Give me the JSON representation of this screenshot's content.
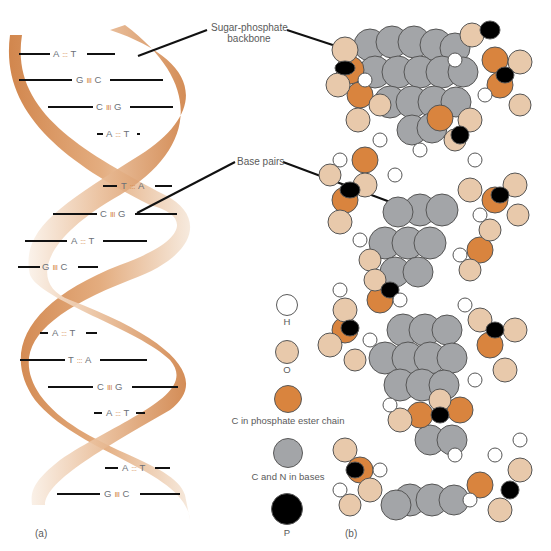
{
  "figure": {
    "panel_a_label": "(a)",
    "panel_b_label": "(b)",
    "callouts": {
      "backbone_line1": "Sugar-phosphate",
      "backbone_line2": "backbone",
      "base_pairs": "Base pairs"
    },
    "base_pairs": [
      {
        "left": "A",
        "bond": ":::",
        "right": "T"
      },
      {
        "left": "G",
        "bond": "III",
        "right": "C"
      },
      {
        "left": "C",
        "bond": "III",
        "right": "G"
      },
      {
        "left": "A",
        "bond": ":::",
        "right": "T"
      },
      {
        "left": "T",
        "bond": ":::",
        "right": "A"
      },
      {
        "left": "C",
        "bond": "III",
        "right": "G"
      },
      {
        "left": "A",
        "bond": ":::",
        "right": "T"
      },
      {
        "left": "G",
        "bond": "III",
        "right": "C"
      },
      {
        "left": "A",
        "bond": ":::",
        "right": "T"
      },
      {
        "left": "T",
        "bond": ":::",
        "right": "A"
      },
      {
        "left": "C",
        "bond": "III",
        "right": "G"
      },
      {
        "left": "A",
        "bond": ":::",
        "right": "T"
      },
      {
        "left": "A",
        "bond": ":::",
        "right": "T"
      },
      {
        "left": "G",
        "bond": "III",
        "right": "C"
      }
    ],
    "legend": [
      {
        "label": "H",
        "color": "#ffffff",
        "icon": "hydrogen-atom-icon"
      },
      {
        "label": "O",
        "color": "#e8c9ab",
        "icon": "oxygen-atom-icon"
      },
      {
        "label": "C in phosphate ester chain",
        "color": "#d9843e",
        "icon": "carbon-chain-atom-icon"
      },
      {
        "label": "C and N in bases",
        "color": "#a3a5a8",
        "icon": "base-atom-icon"
      },
      {
        "label": "P",
        "color": "#000000",
        "icon": "phosphorus-atom-icon"
      }
    ],
    "colors": {
      "ribbon_dark": "#cf8044",
      "ribbon_light": "#f5e6d6",
      "base_gray": "#a3a5a8",
      "oxygen": "#e8c9ab",
      "carbon_orange": "#d9843e",
      "phosphorus": "#000000",
      "hydrogen": "#ffffff"
    }
  }
}
